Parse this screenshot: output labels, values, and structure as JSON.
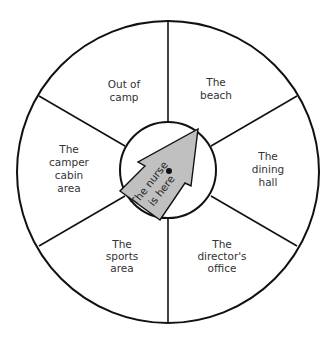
{
  "diagram": {
    "sections": [
      {
        "id": "out-of-camp",
        "lines": [
          "Out of",
          "camp"
        ]
      },
      {
        "id": "beach",
        "lines": [
          "The",
          "beach"
        ]
      },
      {
        "id": "dining-hall",
        "lines": [
          "The",
          "dining",
          "hall"
        ]
      },
      {
        "id": "directors-office",
        "lines": [
          "The",
          "director's",
          "office"
        ]
      },
      {
        "id": "sports-area",
        "lines": [
          "The",
          "sports",
          "area"
        ]
      },
      {
        "id": "camper-cabin-area",
        "lines": [
          "The",
          "camper",
          "cabin",
          "area"
        ]
      }
    ],
    "pointer": {
      "lines": [
        "The nurse",
        "is here"
      ],
      "fill": "#c0c0c0",
      "points_to": "The beach"
    }
  }
}
